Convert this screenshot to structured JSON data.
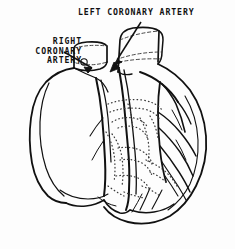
{
  "figure": {
    "type": "anatomical-line-drawing",
    "width": 235,
    "height": 249,
    "background_color": "#fdfdfd",
    "ink_color": "#111111",
    "stipple_color": "#3a3a3a"
  },
  "labels": {
    "left_coronary": {
      "text": "LEFT CORONARY ARTERY",
      "lines": [
        "LEFT CORONARY ARTERY"
      ],
      "align": "left",
      "x": 78,
      "y": 8,
      "leader": "diagonal line from text down-left to arrowhead at left coronary ostium"
    },
    "right_coronary": {
      "text": "RIGHT CORONARY ARTERY",
      "lines": [
        "RIGHT",
        "CORONARY",
        "ARTERY"
      ],
      "align": "right",
      "x": 2,
      "y": 37,
      "leader": "diagonal line from text down-right to arrowhead at right coronary ostium"
    }
  },
  "structures": [
    {
      "name": "aorta",
      "description": "cut cylindrical great vessel, upper right, with dashed hidden-edge ellipse"
    },
    {
      "name": "superior-vena-cava",
      "description": "cut cylindrical vessel, upper left of midline, dashed hidden ellipse"
    },
    {
      "name": "pulmonary-trunk",
      "description": "vessel emerging between aorta and right heart border"
    },
    {
      "name": "right-atrium",
      "description": "large rounded chamber, left side of drawing"
    },
    {
      "name": "right-ventricle",
      "description": "anterior chamber, lower center-left"
    },
    {
      "name": "left-ventricle",
      "description": "rounded chamber, right side, forming apex"
    },
    {
      "name": "left-coronary-artery",
      "description": "descends in anterior interventricular groove, center"
    },
    {
      "name": "right-coronary-artery",
      "description": "runs in atrioventricular groove, left-center"
    },
    {
      "name": "coronary-branches",
      "description": "branching arterial tree over right ventricular and left ventricular walls"
    },
    {
      "name": "epicardial-fat",
      "description": "stippled dotted regions along the grooves"
    },
    {
      "name": "apex",
      "description": "pointed inferior tip of the heart, bottom center"
    }
  ],
  "colors": {
    "ink": "#111111",
    "stipple": "#3a3a3a",
    "dashed": "#333333",
    "paper": "#fdfdfd"
  }
}
